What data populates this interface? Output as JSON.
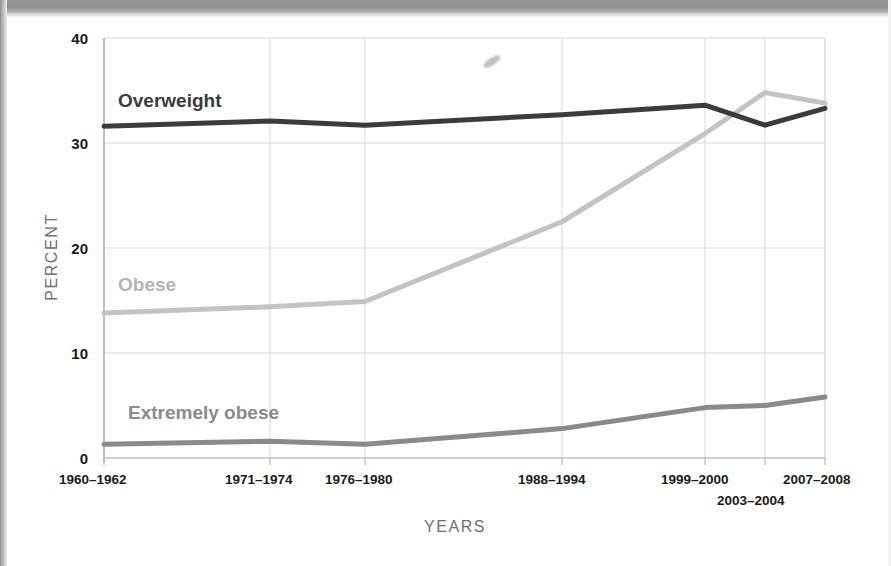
{
  "figure": {
    "y_axis_title": "PERCENT",
    "x_axis_title": "YEARS"
  },
  "labels": {
    "overweight": "Overweight",
    "obese": "Obese",
    "extremely_obese": "Extremely obese"
  },
  "colors": {
    "overweight": "#3b3b3b",
    "obese": "#c3c3c3",
    "extremely_obese": "#8a8a8a",
    "gridline": "#d9d9d9",
    "axis_text": "#1a1a1a",
    "axis_title": "#6f6f6f",
    "background": "#fefefe"
  },
  "yticks": {
    "t0": "0",
    "t10": "10",
    "t20": "20",
    "t30": "30",
    "t40": "40"
  },
  "xticks": {
    "t1": "1960–1962",
    "t2": "1971–1974",
    "t3": "1976–1980",
    "t4": "1988–1994",
    "t5": "1999–2000",
    "t6": "2003–2004",
    "t7": "2007–2008"
  },
  "chart_data": {
    "type": "line",
    "title": "",
    "xlabel": "YEARS",
    "ylabel": "PERCENT",
    "ylim": [
      0,
      40
    ],
    "yticks": [
      0,
      10,
      20,
      30,
      40
    ],
    "grid": true,
    "legend": "inline-labels",
    "categories": [
      "1960–1962",
      "1971–1974",
      "1976–1980",
      "1988–1994",
      "1999–2000",
      "2003–2004",
      "2007–2008"
    ],
    "series": [
      {
        "name": "Overweight",
        "color": "#3b3b3b",
        "values": [
          31.6,
          32.1,
          31.7,
          32.7,
          33.6,
          31.7,
          33.3
        ]
      },
      {
        "name": "Obese",
        "color": "#c3c3c3",
        "values": [
          13.8,
          14.4,
          14.9,
          22.5,
          30.9,
          34.8,
          33.8
        ]
      },
      {
        "name": "Extremely obese",
        "color": "#8a8a8a",
        "values": [
          1.3,
          1.6,
          1.3,
          2.8,
          4.8,
          5.0,
          5.8
        ]
      }
    ]
  }
}
